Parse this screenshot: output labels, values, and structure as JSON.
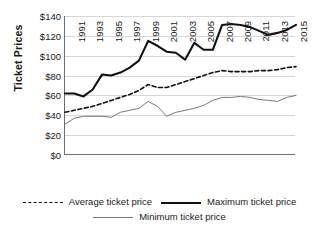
{
  "chart_data": {
    "type": "line",
    "title": "",
    "xlabel": "",
    "ylabel": "Ticket Prices",
    "ylim": [
      0,
      140
    ],
    "ytick_values": [
      0,
      20,
      40,
      60,
      80,
      100,
      120,
      140
    ],
    "ytick_labels": [
      "$0",
      "$20",
      "$40",
      "$60",
      "$80",
      "$100",
      "$120",
      "$140"
    ],
    "grid": true,
    "legend_position": "bottom",
    "x": [
      1991,
      1992,
      1993,
      1994,
      1995,
      1996,
      1997,
      1998,
      1999,
      2000,
      2001,
      2002,
      2003,
      2004,
      2005,
      2006,
      2007,
      2008,
      2009,
      2010,
      2011,
      2012,
      2013,
      2014,
      2015,
      2016
    ],
    "xtick_labels": [
      "1991",
      "1993",
      "1995",
      "1997",
      "1999",
      "2001",
      "2003",
      "2005",
      "2007",
      "2009",
      "2011",
      "2013",
      "2015"
    ],
    "series": [
      {
        "name": "Average ticket price",
        "style": "dashed",
        "color": "#111111",
        "values": [
          43,
          45,
          47,
          49,
          52,
          55,
          58,
          61,
          65,
          71,
          68,
          68,
          71,
          74,
          77,
          80,
          83,
          85,
          84,
          84,
          84,
          85,
          85,
          86,
          88,
          89
        ]
      },
      {
        "name": "Maximum ticket price",
        "style": "solid-thick",
        "color": "#111111",
        "values": [
          62,
          62,
          59,
          66,
          81,
          80,
          83,
          88,
          95,
          115,
          110,
          104,
          103,
          96,
          113,
          106,
          106,
          131,
          132,
          131,
          129,
          125,
          121,
          123,
          126,
          131
        ]
      },
      {
        "name": "Minimum ticket price",
        "style": "solid-thin",
        "color": "#777777",
        "values": [
          31,
          37,
          39,
          39,
          39,
          38,
          43,
          45,
          47,
          54,
          49,
          39,
          43,
          45,
          47,
          50,
          55,
          58,
          58,
          59,
          58,
          56,
          55,
          54,
          58,
          60
        ]
      }
    ]
  },
  "legend": {
    "items": [
      {
        "label": "Average ticket price"
      },
      {
        "label": "Maximum ticket price"
      },
      {
        "label": "Minimum ticket price"
      }
    ]
  }
}
